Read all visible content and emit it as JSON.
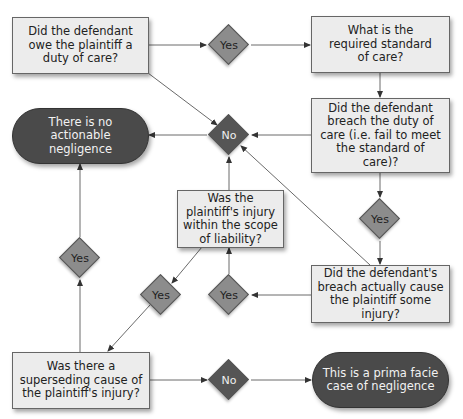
{
  "diagram": {
    "nodes": {
      "duty": {
        "text": "Did the defendant owe the plaintiff a duty of care?",
        "type": "question"
      },
      "standard": {
        "text": "What is the required standard of care?",
        "type": "question"
      },
      "breach": {
        "text": "Did the defendant breach the duty of care (i.e. fail to meet the standard of care)?",
        "type": "question"
      },
      "no_negligence": {
        "text": "There is no actionable negligence",
        "type": "terminal"
      },
      "scope": {
        "text": "Was the plaintiff's injury within the scope of liability?",
        "type": "question"
      },
      "causation": {
        "text": "Did the defendant's breach actually cause the plaintiff some injury?",
        "type": "question"
      },
      "superseding": {
        "text": "Was there a superseding cause of the plaintiff's injury?",
        "type": "question"
      },
      "prima_facie": {
        "text": "This is a prima facie case of negligence",
        "type": "terminal"
      }
    },
    "decisions": {
      "yes_duty": "Yes",
      "no_central": "No",
      "yes_breach": "Yes",
      "yes_causation": "Yes",
      "yes_scope": "Yes",
      "yes_superseding": "Yes",
      "no_superseding": "No"
    },
    "colors": {
      "box_fill": "#ececec",
      "terminal_fill": "#4a4a4a",
      "yes_fill": "#8c8c8c",
      "no_fill": "#555555",
      "edge": "#555555"
    }
  }
}
